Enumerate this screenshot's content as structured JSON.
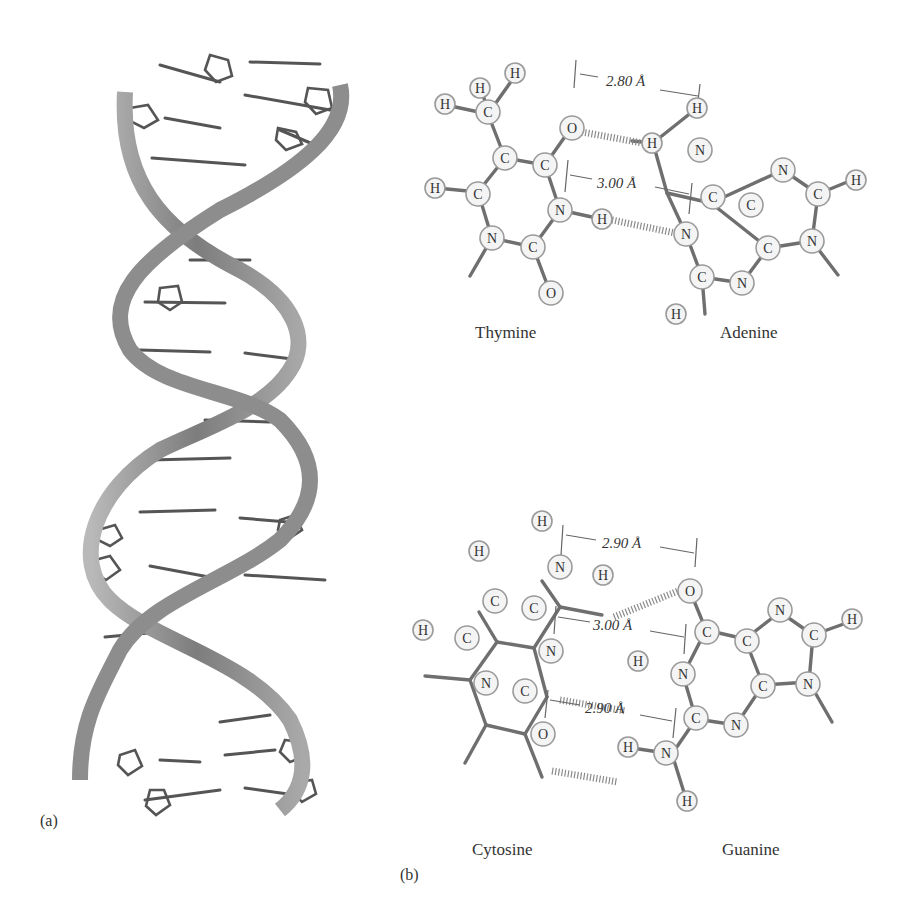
{
  "figure": {
    "panel_a": {
      "label": "(a)",
      "description": "DNA double helix ribbon model with base pair rungs",
      "strand_color": "#8a8a8a",
      "rung_color": "#555555"
    },
    "panel_b": {
      "label": "(b)",
      "pairs": [
        {
          "name": "thymine-adenine",
          "left_base": "Thymine",
          "right_base": "Adenine",
          "hbonds": [
            {
              "distance": "2.80 Å",
              "donor": "H",
              "acceptor": "O"
            },
            {
              "distance": "3.00 Å",
              "donor": "H",
              "acceptor": "N"
            }
          ]
        },
        {
          "name": "cytosine-guanine",
          "left_base": "Cytosine",
          "right_base": "Guanine",
          "hbonds": [
            {
              "distance": "2.90 Å",
              "donor": "H",
              "acceptor": "O"
            },
            {
              "distance": "3.00 Å",
              "donor": "H",
              "acceptor": "N"
            },
            {
              "distance": "2.90 Å",
              "donor": "H",
              "acceptor": "O"
            }
          ]
        }
      ]
    }
  },
  "atoms": {
    "H": "H",
    "C": "C",
    "N": "N",
    "O": "O"
  }
}
